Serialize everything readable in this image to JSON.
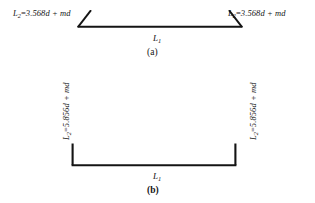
{
  "figure": {
    "panels": [
      {
        "id": "a",
        "caption": "(a)",
        "shape": "splayed-trapezoidal-bracket",
        "base_label": "L",
        "base_label_sub": "1",
        "labels": [
          {
            "position": "left",
            "symbol": "L",
            "subscript": "2",
            "relation": "=",
            "expression": "3.568d + md",
            "full_text": "L2 = 3.568d + md"
          },
          {
            "position": "right",
            "symbol": "L",
            "subscript": "2",
            "relation": "=",
            "expression": "3.568d + md",
            "full_text": "L2 = 3.568d + md"
          }
        ]
      },
      {
        "id": "b",
        "caption": "(b)",
        "shape": "square-u-bracket",
        "base_label": "L",
        "base_label_sub": "1",
        "labels": [
          {
            "position": "left",
            "symbol": "L",
            "subscript": "2",
            "relation": "=",
            "expression": "5.856d + md",
            "full_text": "L2 = 5.856d + md"
          },
          {
            "position": "right",
            "symbol": "L",
            "subscript": "2",
            "relation": "=",
            "expression": "5.856d + md",
            "full_text": "L2 = 5.856d + md"
          }
        ]
      }
    ],
    "colors": {
      "ink": "#141414",
      "background": "#ffffff"
    }
  }
}
